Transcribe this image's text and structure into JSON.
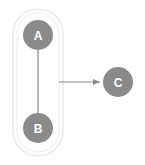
{
  "diagram": {
    "type": "graph",
    "group": {
      "label": "",
      "members": [
        "A",
        "B"
      ]
    },
    "nodes": [
      {
        "id": "A",
        "label": "A",
        "cx": 38,
        "cy": 35
      },
      {
        "id": "B",
        "label": "B",
        "cx": 38,
        "cy": 128
      },
      {
        "id": "C",
        "label": "C",
        "cx": 118,
        "cy": 82
      }
    ],
    "edges": [
      {
        "from": "A",
        "to": "B",
        "directed": false
      },
      {
        "from": "group(A,B)",
        "to": "C",
        "directed": true
      }
    ],
    "colors": {
      "node_fill": "#8a8a8a",
      "node_text": "#ffffff",
      "edge": "#8a8a8a",
      "group_outline": "#d9d9d9"
    }
  }
}
